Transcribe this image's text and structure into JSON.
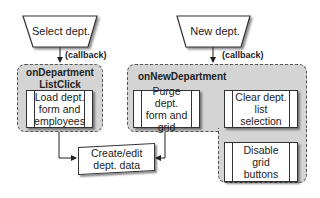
{
  "diagram": {
    "triggers": [
      {
        "id": "select-dept",
        "label": "Select dept."
      },
      {
        "id": "new-dept",
        "label": "New dept."
      }
    ],
    "callback_label": "(callback)",
    "groups": [
      {
        "id": "onDepartmentListClick",
        "title_line1": "onDepartment",
        "title_line2": "ListClick",
        "steps": [
          {
            "id": "load",
            "label_lines": [
              "Load dept.",
              "form and",
              "employees"
            ]
          }
        ]
      },
      {
        "id": "onNewDepartment",
        "title": "onNewDepartment",
        "steps": [
          {
            "id": "purge",
            "label_lines": [
              "Purge dept.",
              "form and",
              "grid"
            ]
          },
          {
            "id": "clear",
            "label_lines": [
              "Clear dept.",
              "list",
              "selection"
            ]
          },
          {
            "id": "disable",
            "label_lines": [
              "Disable grid",
              "buttons"
            ]
          }
        ]
      }
    ],
    "shared_step": {
      "id": "create-edit",
      "label_lines": [
        "Create/edit",
        "dept. data"
      ]
    },
    "edges": [
      {
        "from": "Select dept.",
        "to": "onDepartmentListClick",
        "label": "(callback)"
      },
      {
        "from": "New dept.",
        "to": "onNewDepartment",
        "label": "(callback)"
      },
      {
        "from": "Load dept. form and employees",
        "to": "Create/edit dept. data"
      },
      {
        "from": "Purge dept. form and grid",
        "to": "Create/edit dept. data"
      },
      {
        "from": "Purge dept. form and grid",
        "to": "Clear dept. list selection"
      },
      {
        "from": "Clear dept. list selection",
        "to": "Disable grid buttons"
      }
    ],
    "colors": {
      "group_fill": "#d4d4d4",
      "box_fill": "#ffffff",
      "stroke": "#333333"
    }
  }
}
